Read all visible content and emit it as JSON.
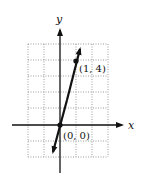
{
  "diagram": {
    "title": "",
    "axes": {
      "x_label": "x",
      "y_label": "y"
    },
    "grid": {
      "x_min": -2,
      "x_max": 3,
      "y_min": -2,
      "y_max": 5,
      "style": "dotted"
    },
    "line": {
      "equation": "y = 4x",
      "slope": 4,
      "arrows": "both"
    },
    "points": [
      {
        "label": "(0, 0)",
        "x": 0,
        "y": 0
      },
      {
        "label": "(1, 4)",
        "x": 1,
        "y": 4
      }
    ],
    "colors": {
      "ink": "#111111",
      "grid": "#9a9a9a",
      "background": "#ffffff"
    }
  }
}
